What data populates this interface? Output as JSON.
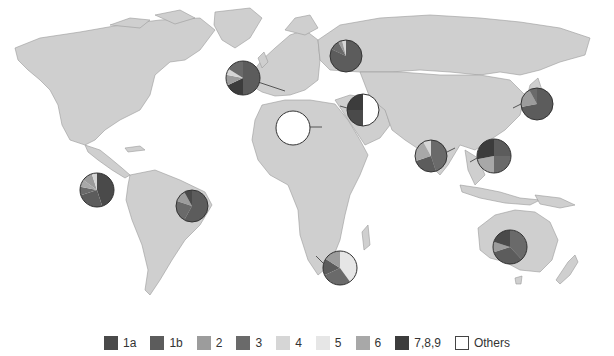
{
  "map": {
    "land_color": "#cfcfcf",
    "border_color": "#9a9a9a",
    "ocean_color": "#ffffff"
  },
  "legend": {
    "items": [
      {
        "key": "1a",
        "label": "1a",
        "color": "#4a4a4a"
      },
      {
        "key": "1b",
        "label": "1b",
        "color": "#5c5c5c"
      },
      {
        "key": "2",
        "label": "2",
        "color": "#9c9c9c"
      },
      {
        "key": "3",
        "label": "3",
        "color": "#6a6a6a"
      },
      {
        "key": "4",
        "label": "4",
        "color": "#d6d6d6"
      },
      {
        "key": "5",
        "label": "5",
        "color": "#e6e6e6"
      },
      {
        "key": "6",
        "label": "6",
        "color": "#a8a8a8"
      },
      {
        "key": "789",
        "label": "7,8,9",
        "color": "#3c3c3c"
      },
      {
        "key": "others",
        "label": "Others",
        "color": "#ffffff"
      }
    ]
  },
  "pies": [
    {
      "region": "north-america",
      "cx": 97,
      "cy": 190,
      "r": 17,
      "leader": null,
      "slices": [
        {
          "key": "1a",
          "v": 45
        },
        {
          "key": "1b",
          "v": 25
        },
        {
          "key": "3",
          "v": 8
        },
        {
          "key": "6",
          "v": 7
        },
        {
          "key": "2",
          "v": 10
        },
        {
          "key": "4",
          "v": 5
        }
      ]
    },
    {
      "region": "europe-west",
      "cx": 243,
      "cy": 78,
      "r": 17,
      "leader": [
        258,
        82,
        285,
        91
      ],
      "slices": [
        {
          "key": "1b",
          "v": 50
        },
        {
          "key": "789",
          "v": 18
        },
        {
          "key": "2",
          "v": 10
        },
        {
          "key": "4",
          "v": 6
        },
        {
          "key": "3",
          "v": 16
        }
      ]
    },
    {
      "region": "russia",
      "cx": 346,
      "cy": 56,
      "r": 16,
      "leader": null,
      "slices": [
        {
          "key": "1b",
          "v": 82
        },
        {
          "key": "3",
          "v": 10
        },
        {
          "key": "2",
          "v": 4
        },
        {
          "key": "4",
          "v": 4
        }
      ]
    },
    {
      "region": "middle-east",
      "cx": 363,
      "cy": 110,
      "r": 16,
      "leader": [
        347,
        108,
        340,
        106
      ],
      "slices": [
        {
          "key": "others",
          "v": 50
        },
        {
          "key": "1a",
          "v": 25
        },
        {
          "key": "789",
          "v": 25
        }
      ]
    },
    {
      "region": "north-africa",
      "cx": 293,
      "cy": 128,
      "r": 17,
      "leader": [
        310,
        127,
        322,
        127
      ],
      "slices": [
        {
          "key": "others",
          "v": 100
        }
      ]
    },
    {
      "region": "south-asia",
      "cx": 431,
      "cy": 156,
      "r": 16,
      "leader": [
        447,
        152,
        455,
        148
      ],
      "slices": [
        {
          "key": "3",
          "v": 45
        },
        {
          "key": "1b",
          "v": 25
        },
        {
          "key": "6",
          "v": 22
        },
        {
          "key": "4",
          "v": 8
        }
      ]
    },
    {
      "region": "east-asia-se",
      "cx": 494,
      "cy": 156,
      "r": 17,
      "leader": [
        477,
        158,
        470,
        162
      ],
      "slices": [
        {
          "key": "1b",
          "v": 25
        },
        {
          "key": "3",
          "v": 25
        },
        {
          "key": "6",
          "v": 22
        },
        {
          "key": "789",
          "v": 28
        }
      ]
    },
    {
      "region": "japan",
      "cx": 537,
      "cy": 104,
      "r": 16,
      "leader": [
        521,
        104,
        513,
        108
      ],
      "slices": [
        {
          "key": "1b",
          "v": 72
        },
        {
          "key": "2",
          "v": 20
        },
        {
          "key": "3",
          "v": 8
        }
      ]
    },
    {
      "region": "south-america",
      "cx": 192,
      "cy": 206,
      "r": 16,
      "leader": null,
      "slices": [
        {
          "key": "1b",
          "v": 58
        },
        {
          "key": "3",
          "v": 22
        },
        {
          "key": "2",
          "v": 12
        },
        {
          "key": "1a",
          "v": 8
        }
      ]
    },
    {
      "region": "south-africa",
      "cx": 340,
      "cy": 268,
      "r": 17,
      "leader": [
        323,
        263,
        316,
        256
      ],
      "slices": [
        {
          "key": "5",
          "v": 40
        },
        {
          "key": "3",
          "v": 28
        },
        {
          "key": "1b",
          "v": 16
        },
        {
          "key": "2",
          "v": 16
        }
      ]
    },
    {
      "region": "australia",
      "cx": 510,
      "cy": 247,
      "r": 17,
      "leader": null,
      "slices": [
        {
          "key": "3",
          "v": 38
        },
        {
          "key": "1b",
          "v": 32
        },
        {
          "key": "2",
          "v": 10
        },
        {
          "key": "1a",
          "v": 20
        }
      ]
    }
  ]
}
